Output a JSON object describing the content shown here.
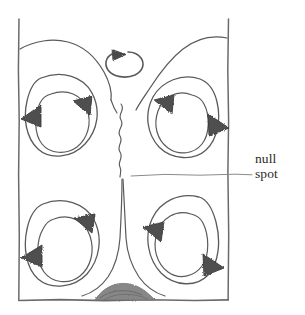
{
  "figure": {
    "annotations": [
      {
        "id": "null-spot",
        "line1": "null",
        "line2": "spot"
      }
    ],
    "colors": {
      "ink": "#4a4a4a",
      "ink_dark": "#3a3a3a",
      "arrow_fill": "#5a5a5a",
      "frame": "#6b6b6b",
      "mound": "#7a7a7a",
      "background": "#ffffff",
      "text": "#2b2b2b"
    },
    "elements": {
      "frame_left_label": "left wall",
      "frame_right_label": "right wall",
      "frame_bottom_label": "floor",
      "center_wavy_label": "rising plume",
      "center_stem_label": "descending stem",
      "mound_label": "heat source mound",
      "small_circle_label": "small circulation"
    },
    "cells": [
      {
        "id": "top-left",
        "rotation": "counterclockwise",
        "arrows": 2
      },
      {
        "id": "top-right",
        "rotation": "clockwise",
        "arrows": 2
      },
      {
        "id": "bottom-left",
        "rotation": "clockwise",
        "arrows": 2
      },
      {
        "id": "bottom-right",
        "rotation": "counterclockwise",
        "arrows": 2
      }
    ]
  }
}
